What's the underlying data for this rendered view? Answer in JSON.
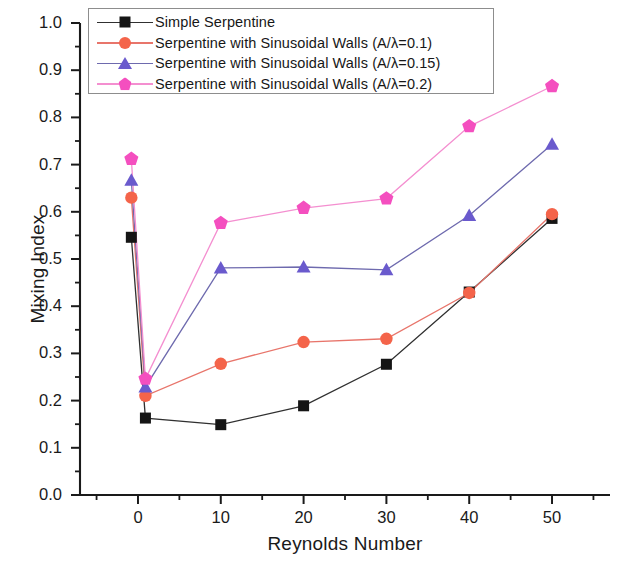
{
  "chart_data": {
    "type": "line",
    "title": "",
    "xlabel": "Reynolds Number",
    "ylabel": "Mixing Index",
    "xlim": [
      -7,
      57
    ],
    "ylim": [
      0.0,
      1.0
    ],
    "xticks": [
      0,
      10,
      20,
      30,
      40,
      50
    ],
    "xtick_labels": [
      "0",
      "10",
      "20",
      "30",
      "40",
      "50"
    ],
    "yticks": [
      0.0,
      0.1,
      0.2,
      0.3,
      0.4,
      0.5,
      0.6,
      0.7,
      0.8,
      0.9,
      1.0
    ],
    "ytick_labels": [
      "0.0",
      "0.1",
      "0.2",
      "0.3",
      "0.4",
      "0.5",
      "0.6",
      "0.7",
      "0.8",
      "0.9",
      "1.0"
    ],
    "minor_ticks": true,
    "grid": false,
    "legend_position": "top-left-inside",
    "x": [
      -0.8,
      0.9,
      10,
      20,
      30,
      40,
      50
    ],
    "series": [
      {
        "name": "Simple Serpentine",
        "label": "Simple Serpentine",
        "marker": "square",
        "color": "#151515",
        "line_color": "#303030",
        "values": [
          0.546,
          0.163,
          0.149,
          0.189,
          0.277,
          0.43,
          0.586
        ]
      },
      {
        "name": "Serpentine with Sinusoidal Walls (A/λ=0.1)",
        "label_main": "Serpentine with Sinusoidal Walls (A/",
        "label_sub": "λ=0.1)",
        "marker": "circle",
        "color": "#F4644A",
        "line_color": "#E8756B",
        "values": [
          0.63,
          0.21,
          0.278,
          0.324,
          0.331,
          0.428,
          0.595
        ]
      },
      {
        "name": "Serpentine with Sinusoidal Walls (A/λ=0.15)",
        "label_main": "Serpentine with Sinusoidal Walls (A/",
        "label_sub": "λ=0.15)",
        "marker": "triangle",
        "color": "#6A5ACD",
        "line_color": "#6E6AAE",
        "values": [
          0.667,
          0.229,
          0.481,
          0.483,
          0.477,
          0.592,
          0.743
        ]
      },
      {
        "name": "Serpentine with Sinusoidal Walls (A/λ=0.2)",
        "label_main": "Serpentine with Sinusoidal Walls (A/",
        "label_sub": "λ=0.2)",
        "marker": "pentagon",
        "color": "#F44FBF",
        "line_color": "#F48FD0",
        "values": [
          0.712,
          0.246,
          0.576,
          0.608,
          0.628,
          0.781,
          0.866
        ]
      }
    ]
  },
  "axes": {
    "x_title": "Reynolds Number",
    "y_title": "Mixing Index"
  },
  "legend": {
    "entries": [
      {
        "text": "Simple Serpentine",
        "sub": ""
      },
      {
        "text": "Serpentine with Sinusoidal Walls (A/λ=0.1)",
        "sub": ""
      },
      {
        "text": "Serpentine with Sinusoidal Walls (A/λ=0.15)",
        "sub": ""
      },
      {
        "text": "Serpentine with Sinusoidal Walls (A/λ=0.2)",
        "sub": ""
      }
    ]
  },
  "colors": {
    "simple_serpentine": "#151515",
    "ratio_010": "#F4644A",
    "ratio_015": "#6A5ACD",
    "ratio_020": "#F44FBF",
    "axis": "#1a1a1a",
    "background": "#ffffff"
  }
}
